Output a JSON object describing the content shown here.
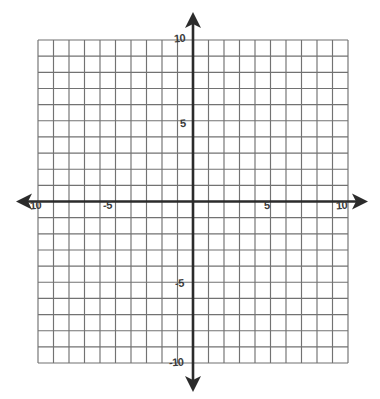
{
  "figure": {
    "kind": "cartesian-coordinate-grid",
    "background_color": "#ffffff",
    "grid_line_color": "#6b6b6b",
    "axis_line_color": "#2b2b2b",
    "label_color": "#3a3a3a"
  },
  "chart_data": {
    "type": "scatter",
    "title": "",
    "subtitle": "",
    "xlabel": "",
    "ylabel": "",
    "xlim": [
      -10,
      10
    ],
    "ylim": [
      -10,
      10
    ],
    "grid": true,
    "grid_step": 1,
    "legend": null,
    "legend_position": "none",
    "series": [],
    "x": [],
    "y": [],
    "annotations": [],
    "x_tick_labels": [
      "10",
      "-5",
      "5",
      "10"
    ],
    "y_tick_labels": [
      "10",
      "5",
      "-5",
      "-10"
    ],
    "x_ticks_shown": [
      -10,
      -5,
      5,
      10
    ],
    "y_ticks_shown": [
      10,
      5,
      -5,
      -10
    ],
    "columns": 20,
    "rows": 20
  },
  "labels": {
    "x_neg_end": "10",
    "x_neg_five": "-5",
    "x_pos_five": "5",
    "x_pos_end": "10",
    "y_pos_end": "10",
    "y_pos_five": "5",
    "y_neg_five": "-5",
    "y_neg_end": "-10"
  },
  "icons": {
    "arrow_left": "x-axis-left-arrow",
    "arrow_right": "x-axis-right-arrow",
    "arrow_up": "y-axis-up-arrow",
    "arrow_down": "y-axis-down-arrow"
  }
}
